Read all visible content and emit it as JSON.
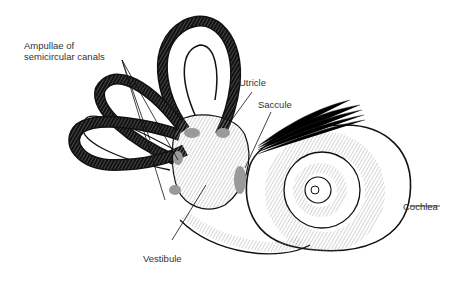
{
  "diagram": {
    "labels": {
      "ampullae": [
        "Ampullae of",
        "semicircular canals"
      ],
      "utricle": "Utricle",
      "saccule": "Saccule",
      "cochlea": "Cochlea",
      "vestibule": "Vestibule"
    },
    "colors": {
      "outline": "#111111",
      "hatch": "#999999",
      "shaded": "#9a9a9a",
      "label_text": "#333333",
      "background": "#ffffff"
    }
  }
}
